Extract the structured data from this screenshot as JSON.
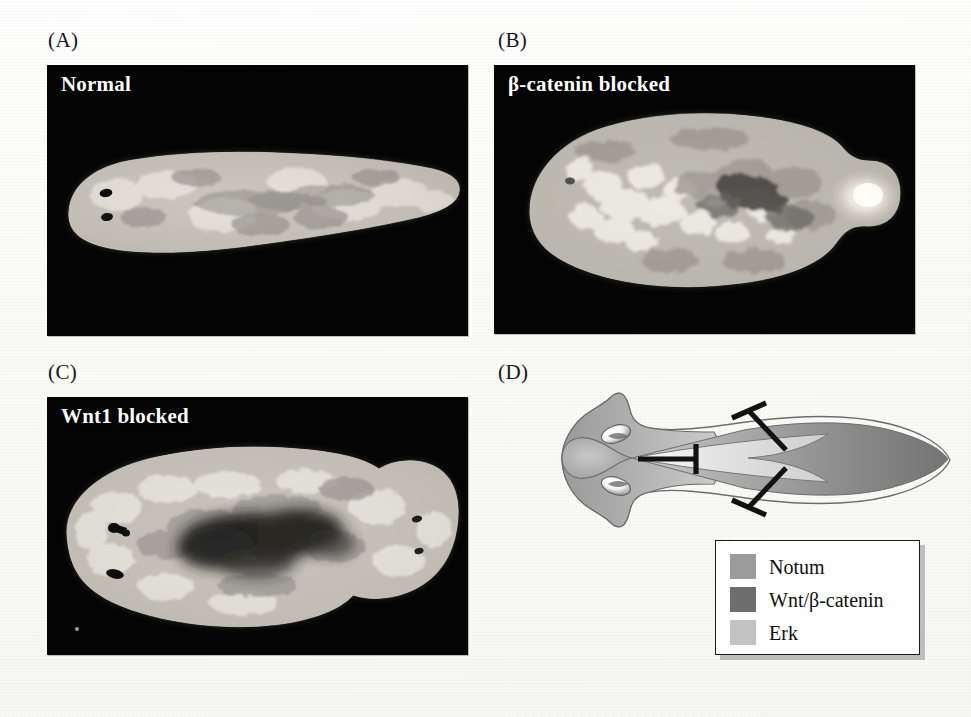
{
  "figure": {
    "panels": [
      {
        "id": "A",
        "label": "(A)",
        "caption": "Normal"
      },
      {
        "id": "B",
        "label": "(B)",
        "caption": "β-catenin blocked"
      },
      {
        "id": "C",
        "label": "(C)",
        "caption": "Wnt1 blocked"
      },
      {
        "id": "D",
        "label": "(D)",
        "caption": ""
      }
    ]
  },
  "legend": {
    "items": [
      {
        "label": "Notum",
        "color": "#9b9b9b"
      },
      {
        "label": "Wnt/β-catenin",
        "color": "#6d6d6d"
      },
      {
        "label": "Erk",
        "color": "#c3c3c3"
      }
    ]
  },
  "diagram": {
    "regions": [
      {
        "name": "Notum",
        "color": "#a9a9a9"
      },
      {
        "name": "Wnt/β-catenin",
        "color": "#878787"
      },
      {
        "name": "Erk",
        "color": "#cdcdcd"
      }
    ],
    "inhibition_arrows": [
      {
        "name": "erk-inhibits-notum",
        "from": "Erk",
        "to": "Notum"
      },
      {
        "name": "wnt-inhibits-erk-dorsal",
        "from": "Wnt/β-catenin",
        "to": "Erk"
      },
      {
        "name": "wnt-inhibits-erk-ventral",
        "from": "Wnt/β-catenin",
        "to": "Erk"
      }
    ],
    "anatomy": [
      {
        "name": "eye-spot-dorsal"
      },
      {
        "name": "eye-spot-ventral"
      },
      {
        "name": "body-outline"
      }
    ]
  },
  "specimens": {
    "a": {
      "description": "single-headed planarian, two eye spots anterior, tapered tail"
    },
    "b": {
      "description": "radially blob-shaped planarian, tail-less, bright posterior pole"
    },
    "c": {
      "description": "two-headed planarian, eye spots at both ends, dark central pharynx"
    }
  },
  "colors": {
    "page_background": "#fdfdfb",
    "photo_background": "#040404",
    "caption_text": "#fdfdfd",
    "label_text": "#15161a",
    "outline": "#5d5d5d",
    "arrow": "#111111"
  }
}
